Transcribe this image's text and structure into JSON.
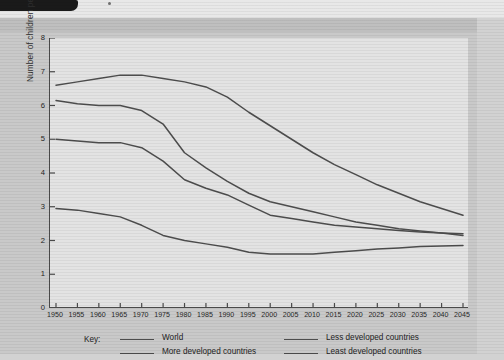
{
  "page": {
    "background_color": "#d2d2d2",
    "panel_color": "#c9c9c9",
    "plot_background_color": "#e3e3e3",
    "line_color": "#4d4d4d",
    "axis_color": "#4a4a4a"
  },
  "legend": {
    "key_label": "Key:",
    "items": [
      {
        "label": "World",
        "column": 1,
        "row": 1
      },
      {
        "label": "More developed countries",
        "column": 1,
        "row": 2
      },
      {
        "label": "Less developed countries",
        "column": 2,
        "row": 1
      },
      {
        "label": "Least developed countries",
        "column": 2,
        "row": 2
      }
    ]
  },
  "chart_data": {
    "type": "line",
    "title": "",
    "xlabel": "",
    "ylabel": "Number of children per woman",
    "xlim": [
      1950,
      2045
    ],
    "ylim": [
      0,
      8
    ],
    "grid": false,
    "legend_position": "below",
    "x": [
      1950,
      1955,
      1960,
      1965,
      1970,
      1975,
      1980,
      1985,
      1990,
      1995,
      2000,
      2005,
      2010,
      2015,
      2020,
      2025,
      2030,
      2035,
      2040,
      2045
    ],
    "ytick_labels": [
      "0",
      "1",
      "2",
      "3",
      "4",
      "5",
      "6",
      "7",
      "8"
    ],
    "xtick_labels": [
      "1950",
      "1955",
      "1960",
      "1965",
      "1970",
      "1975",
      "1980",
      "1985",
      "1990",
      "1995",
      "2000",
      "2005",
      "2010",
      "2015",
      "2020",
      "2025",
      "2030",
      "2035",
      "2040",
      "2045"
    ],
    "series": [
      {
        "name": "World",
        "values": [
          5.0,
          4.95,
          4.9,
          4.9,
          4.75,
          4.35,
          3.8,
          3.55,
          3.35,
          3.05,
          2.75,
          2.65,
          2.55,
          2.45,
          2.4,
          2.35,
          2.3,
          2.25,
          2.22,
          2.2
        ]
      },
      {
        "name": "More developed countries",
        "values": [
          2.95,
          2.9,
          2.8,
          2.7,
          2.45,
          2.15,
          2.0,
          1.9,
          1.8,
          1.65,
          1.6,
          1.6,
          1.6,
          1.65,
          1.7,
          1.75,
          1.78,
          1.82,
          1.84,
          1.85
        ]
      },
      {
        "name": "Less developed countries",
        "values": [
          6.15,
          6.05,
          6.0,
          6.0,
          5.85,
          5.45,
          4.6,
          4.15,
          3.75,
          3.4,
          3.15,
          3.0,
          2.85,
          2.7,
          2.55,
          2.45,
          2.35,
          2.28,
          2.22,
          2.15
        ]
      },
      {
        "name": "Least developed countries",
        "values": [
          6.6,
          6.7,
          6.8,
          6.9,
          6.9,
          6.8,
          6.7,
          6.55,
          6.25,
          5.8,
          5.4,
          5.0,
          4.6,
          4.25,
          3.95,
          3.65,
          3.4,
          3.15,
          2.95,
          2.75
        ]
      }
    ]
  }
}
